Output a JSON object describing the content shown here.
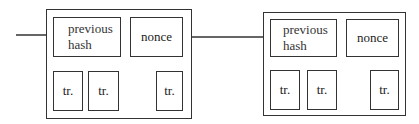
{
  "blocks": [
    {
      "previous_hash_label": "previous\nhash",
      "previous_hash_line1": "previous",
      "previous_hash_line2": "hash",
      "nonce_label": "nonce",
      "transactions": [
        "tr.",
        "tr.",
        "tr."
      ]
    },
    {
      "previous_hash_line1": "previous",
      "previous_hash_line2": "hash",
      "nonce_label": "nonce",
      "transactions": [
        "tr.",
        "tr.",
        "tr."
      ]
    }
  ],
  "colors": {
    "stroke": "#333333",
    "background": "#ffffff"
  }
}
